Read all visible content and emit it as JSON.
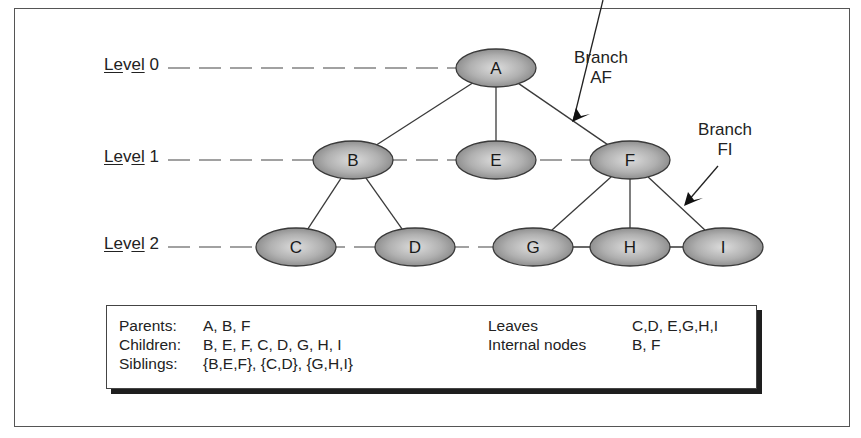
{
  "levels": [
    {
      "prefix": "Le",
      "mid": "v",
      "underlined": "el",
      "num": " 0",
      "label": "Level 0",
      "y": 68
    },
    {
      "prefix": "Le",
      "mid": "v",
      "underlined": "el",
      "num": " 1",
      "label": "Level 1",
      "y": 160
    },
    {
      "prefix": "Le",
      "mid": "v",
      "underlined": "el",
      "num": " 2",
      "label": "Level 2",
      "y": 247
    }
  ],
  "nodes": [
    {
      "id": "A",
      "x": 496,
      "y": 68
    },
    {
      "id": "B",
      "x": 353,
      "y": 160
    },
    {
      "id": "E",
      "x": 496,
      "y": 160
    },
    {
      "id": "F",
      "x": 630,
      "y": 160
    },
    {
      "id": "C",
      "x": 296,
      "y": 247
    },
    {
      "id": "D",
      "x": 415,
      "y": 247
    },
    {
      "id": "G",
      "x": 533,
      "y": 247
    },
    {
      "id": "H",
      "x": 630,
      "y": 247
    },
    {
      "id": "I",
      "x": 723,
      "y": 247
    }
  ],
  "edges": [
    [
      "A",
      "B"
    ],
    [
      "A",
      "E"
    ],
    [
      "A",
      "F"
    ],
    [
      "B",
      "C"
    ],
    [
      "B",
      "D"
    ],
    [
      "F",
      "G"
    ],
    [
      "F",
      "H"
    ],
    [
      "F",
      "I"
    ]
  ],
  "branch_labels": [
    {
      "line1": "Branch",
      "line2": "AF"
    },
    {
      "line1": "Branch",
      "line2": "FI"
    }
  ],
  "legend": {
    "left": [
      {
        "key": "Parents:",
        "value": "A, B, F"
      },
      {
        "key": "Children:",
        "value": "B, E, F, C, D, G, H, I"
      },
      {
        "key": "Siblings:",
        "value": "{B,E,F}, {C,D}, {G,H,I}"
      }
    ],
    "right": [
      {
        "key": "Leaves",
        "value": "C,D, E,G,H,I"
      },
      {
        "key": "Internal nodes",
        "value": "B, F"
      }
    ]
  },
  "colors": {
    "node_fill_center": "#d9d9d9",
    "node_fill_edge": "#8c8c8c",
    "stroke": "#3a3a3a"
  }
}
